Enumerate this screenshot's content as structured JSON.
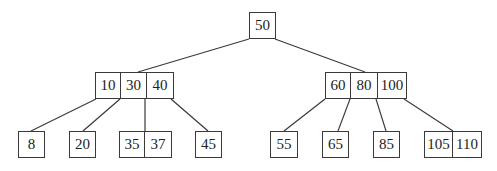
{
  "diagram": {
    "type": "b-tree",
    "colors": {
      "stroke": "#3a3a3a",
      "text": "#222222",
      "background": "#ffffff"
    },
    "nodes": [
      {
        "id": "root",
        "level": 0,
        "x": 249,
        "y": 12,
        "keys": [
          "50"
        ],
        "widths": [
          27
        ]
      },
      {
        "id": "left",
        "level": 1,
        "x": 95,
        "y": 72,
        "keys": [
          "10",
          "30",
          "40"
        ],
        "widths": [
          26,
          26,
          27
        ]
      },
      {
        "id": "right",
        "level": 1,
        "x": 325,
        "y": 72,
        "keys": [
          "60",
          "80",
          "100"
        ],
        "widths": [
          26,
          27,
          29
        ]
      },
      {
        "id": "leaf1",
        "level": 2,
        "x": 18,
        "y": 131,
        "keys": [
          "8"
        ],
        "widths": [
          27
        ]
      },
      {
        "id": "leaf2",
        "level": 2,
        "x": 69,
        "y": 131,
        "keys": [
          "20"
        ],
        "widths": [
          27
        ]
      },
      {
        "id": "leaf3",
        "level": 2,
        "x": 119,
        "y": 131,
        "keys": [
          "35",
          "37"
        ],
        "widths": [
          26,
          27
        ]
      },
      {
        "id": "leaf4",
        "level": 2,
        "x": 195,
        "y": 131,
        "keys": [
          "45"
        ],
        "widths": [
          27
        ]
      },
      {
        "id": "leaf5",
        "level": 2,
        "x": 270,
        "y": 131,
        "keys": [
          "55"
        ],
        "widths": [
          28
        ]
      },
      {
        "id": "leaf6",
        "level": 2,
        "x": 322,
        "y": 131,
        "keys": [
          "65"
        ],
        "widths": [
          27
        ]
      },
      {
        "id": "leaf7",
        "level": 2,
        "x": 373,
        "y": 131,
        "keys": [
          "85"
        ],
        "widths": [
          27
        ]
      },
      {
        "id": "leaf8",
        "level": 2,
        "x": 424,
        "y": 131,
        "keys": [
          "105",
          "110"
        ],
        "widths": [
          29,
          29
        ]
      }
    ],
    "edges": [
      {
        "from": "root",
        "to": "left",
        "x1": 249,
        "y1": 39,
        "x2": 138,
        "y2": 72
      },
      {
        "from": "root",
        "to": "right",
        "x1": 275,
        "y1": 39,
        "x2": 365,
        "y2": 72
      },
      {
        "from": "left",
        "to": "leaf1",
        "x1": 96,
        "y1": 99,
        "x2": 31,
        "y2": 131
      },
      {
        "from": "left",
        "to": "leaf2",
        "x1": 120,
        "y1": 99,
        "x2": 83,
        "y2": 131
      },
      {
        "from": "left",
        "to": "leaf3",
        "x1": 145,
        "y1": 99,
        "x2": 145,
        "y2": 131
      },
      {
        "from": "left",
        "to": "leaf4",
        "x1": 171,
        "y1": 99,
        "x2": 208,
        "y2": 131
      },
      {
        "from": "right",
        "to": "leaf5",
        "x1": 325,
        "y1": 99,
        "x2": 284,
        "y2": 131
      },
      {
        "from": "right",
        "to": "leaf6",
        "x1": 350,
        "y1": 99,
        "x2": 338,
        "y2": 131
      },
      {
        "from": "right",
        "to": "leaf7",
        "x1": 376,
        "y1": 99,
        "x2": 386,
        "y2": 131
      },
      {
        "from": "right",
        "to": "leaf8",
        "x1": 404,
        "y1": 99,
        "x2": 453,
        "y2": 131
      }
    ]
  }
}
